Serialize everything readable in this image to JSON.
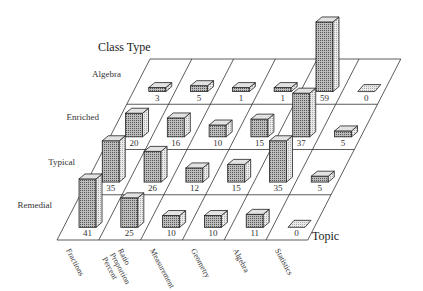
{
  "chart_data": {
    "type": "bar3d",
    "title": "",
    "row_axis_title": "Class Type",
    "col_axis_title": "Topic",
    "rows": [
      "Algebra",
      "Enriched",
      "Typical",
      "Remedial"
    ],
    "columns": [
      "Fractions",
      "Ratio Proportion Percent",
      "Measurement",
      "Geometry",
      "Algebra",
      "Statistics"
    ],
    "column_labels_display": [
      "Fractions",
      "Ratio\nProportion\nPercent",
      "Measurement",
      "Geometry",
      "Algebra",
      "Statistics"
    ],
    "values": {
      "Algebra": [
        3,
        5,
        1,
        1,
        59,
        0
      ],
      "Enriched": [
        20,
        16,
        10,
        15,
        37,
        5
      ],
      "Typical": [
        35,
        26,
        12,
        15,
        35,
        5
      ],
      "Remedial": [
        41,
        25,
        10,
        10,
        11,
        0
      ]
    },
    "series": [
      {
        "name": "Algebra",
        "values": [
          3,
          5,
          1,
          1,
          59,
          0
        ]
      },
      {
        "name": "Enriched",
        "values": [
          20,
          16,
          10,
          15,
          37,
          5
        ]
      },
      {
        "name": "Typical",
        "values": [
          35,
          26,
          12,
          15,
          35,
          5
        ]
      },
      {
        "name": "Remedial",
        "values": [
          41,
          25,
          10,
          10,
          11,
          0
        ]
      }
    ],
    "categories": [
      "Fractions",
      "Ratio Proportion Percent",
      "Measurement",
      "Geometry",
      "Algebra",
      "Statistics"
    ],
    "grid": true,
    "legend": "none"
  },
  "labels": {
    "row_axis_title": "Class Type",
    "col_axis_title": "Topic",
    "rows": [
      "Algebra",
      "Enriched",
      "Typical",
      "Remedial"
    ],
    "columns": [
      "Fractions",
      "Ratio\nProportion\nPercent",
      "Measurement",
      "Geometry",
      "Algebra",
      "Statistics"
    ]
  },
  "colors": {
    "line": "#333333",
    "front_fill": "#9a9a9a",
    "top_fill": "#e2e2e2",
    "side_fill": "#d4d4d4"
  }
}
